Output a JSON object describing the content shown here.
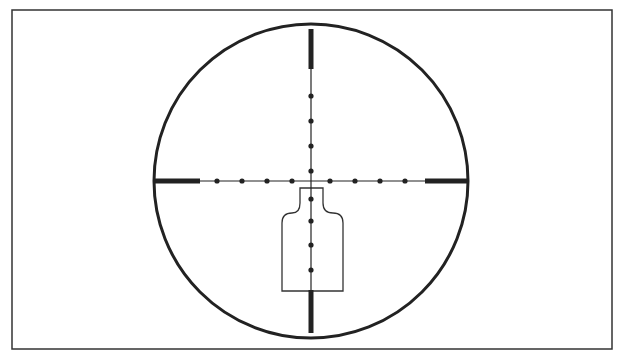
{
  "diagram": {
    "type": "riflescope-reticle",
    "frame": {
      "x": 12,
      "y": 10,
      "width": 600,
      "height": 339,
      "stroke": "#333333"
    },
    "reticle_circle": {
      "cx": 311,
      "cy": 181,
      "r": 157,
      "stroke": "#222222",
      "stroke_width": 3
    },
    "crosshair": {
      "center": [
        311,
        181
      ],
      "thin_line_color": "#222222",
      "thick_posts": [
        {
          "name": "left",
          "x1": 154,
          "y1": 181,
          "x2": 200,
          "y2": 181
        },
        {
          "name": "right",
          "x1": 425,
          "y1": 181,
          "x2": 468,
          "y2": 181
        },
        {
          "name": "top",
          "x1": 311,
          "y1": 29,
          "x2": 311,
          "y2": 69
        },
        {
          "name": "bottom",
          "x1": 311,
          "y1": 290,
          "x2": 311,
          "y2": 333
        }
      ],
      "horizontal_dots_x": [
        217,
        242,
        267,
        292,
        330,
        355,
        380,
        405
      ],
      "vertical_dots_y": [
        96,
        121,
        146,
        171,
        199,
        221,
        245,
        270
      ]
    },
    "target_silhouette": {
      "points": "300,188 323,188 323,203 Q323,213 333,213 Q343,213 343,223 343,291 282,291 282,223 Q282,213 292,213 Q300,213 300,203 Z",
      "stroke": "#333333"
    },
    "background": "#ffffff"
  }
}
